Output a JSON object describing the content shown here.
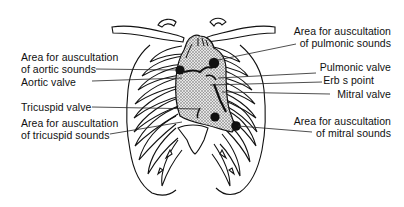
{
  "diagram": {
    "colors": {
      "ink": "#111111",
      "heart_fill": "#bdbdbd",
      "background": "#ffffff"
    },
    "labels_left": [
      {
        "id": "aortic-area",
        "line1": "Area for auscultation",
        "line2": "of aortic sounds"
      },
      {
        "id": "aortic-valve",
        "line1": "Aortic valve"
      },
      {
        "id": "tricuspid-valve",
        "line1": "Tricuspid valve"
      },
      {
        "id": "tricuspid-area",
        "line1": "Area for auscultation",
        "line2": "of tricuspid sounds"
      }
    ],
    "labels_right": [
      {
        "id": "pulmonic-area",
        "line1": "Area for auscultation",
        "line2": "of pulmonic sounds"
      },
      {
        "id": "pulmonic-valve",
        "line1": "Pulmonic valve"
      },
      {
        "id": "erbs-point",
        "line1": "Erb s point"
      },
      {
        "id": "mitral-valve",
        "line1": "Mitral valve"
      },
      {
        "id": "mitral-area",
        "line1": "Area for auscultation",
        "line2": "of mitral sounds"
      }
    ]
  }
}
